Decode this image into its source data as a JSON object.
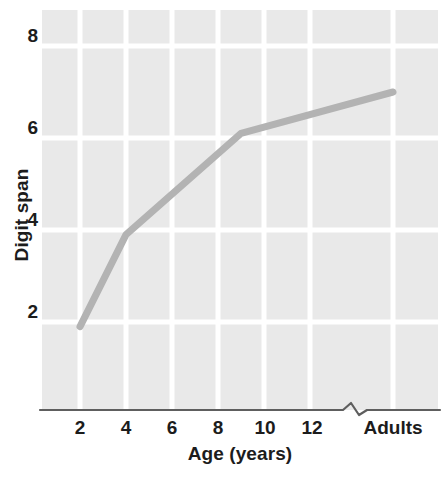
{
  "figure": {
    "axis_color": "#5e5e5e",
    "panel_color": "#e9e9e9",
    "gridline_color": "#ffffff",
    "line_color": "#b3b3b3",
    "text_color": "#1c1c1c"
  },
  "axes": {
    "y_title": "Digit span",
    "x_title": "Age (years)",
    "y_ticks": [
      {
        "label": "8",
        "value": 8
      },
      {
        "label": "6",
        "value": 6
      },
      {
        "label": "4",
        "value": 4
      },
      {
        "label": "2",
        "value": 2
      }
    ],
    "x_ticks": [
      {
        "label": "2",
        "value": 2
      },
      {
        "label": "4",
        "value": 4
      },
      {
        "label": "6",
        "value": 6
      },
      {
        "label": "8",
        "value": 8
      },
      {
        "label": "10",
        "value": 10
      },
      {
        "label": "12",
        "value": 12
      },
      {
        "label": "Adults",
        "value": 16
      }
    ],
    "axis_break": true
  },
  "chart_data": {
    "type": "line",
    "title": "",
    "subtitle": "",
    "xlabel": "Age (years)",
    "ylabel": "Digit span",
    "xlim": [
      1,
      17
    ],
    "ylim": [
      0,
      8.7
    ],
    "grid": true,
    "legend": "none",
    "x_is_categorical_tail": true,
    "x_tick_labels": [
      "2",
      "4",
      "6",
      "8",
      "10",
      "12",
      "Adults"
    ],
    "y_tick_labels": [
      "8",
      "6",
      "4",
      "2"
    ],
    "series": [
      {
        "name": "Digit span",
        "x": [
          2,
          4,
          9,
          16
        ],
        "x_labels": [
          "2",
          "4",
          "9",
          "Adults"
        ],
        "values": [
          1.9,
          3.9,
          6.1,
          7.0
        ]
      }
    ]
  }
}
